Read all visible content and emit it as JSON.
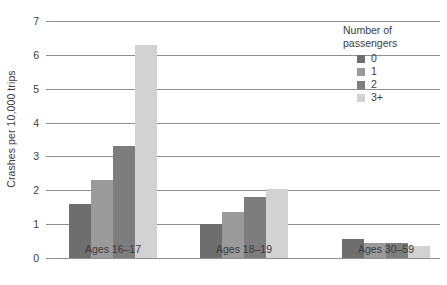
{
  "chart_data": {
    "type": "bar",
    "title": "",
    "subtitle": "",
    "xlabel": "",
    "ylabel": "Crashes per 10,000 trips",
    "ylim": [
      0,
      7
    ],
    "yticks": [
      0,
      1,
      2,
      3,
      4,
      5,
      6,
      7
    ],
    "ytick_labels": [
      "0",
      "1",
      "2",
      "3",
      "4",
      "5",
      "6",
      "7"
    ],
    "grid": true,
    "grid_axis": "y",
    "legend_position": "top-right",
    "legend_title": "Number of\npassengers",
    "categories": [
      "Ages 16–17",
      "Ages 18–19",
      "Ages 30–59"
    ],
    "series": [
      {
        "name": "0",
        "color": "#6e6e6e",
        "values": [
          1.6,
          1.0,
          0.55
        ]
      },
      {
        "name": "1",
        "color": "#9a9a9a",
        "values": [
          2.3,
          1.35,
          0.45
        ]
      },
      {
        "name": "2",
        "color": "#7d7d7d",
        "values": [
          3.3,
          1.8,
          0.45
        ]
      },
      {
        "name": "3+",
        "color": "#d2d2d2",
        "values": [
          6.3,
          2.05,
          0.35
        ]
      }
    ]
  },
  "style": {
    "background": "#ffffff",
    "gridline_color": "#8e8e8e",
    "text_color": "#3c3c3c"
  }
}
